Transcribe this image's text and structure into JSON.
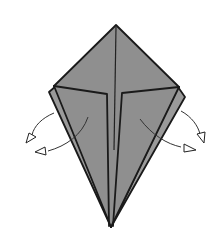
{
  "diagram": {
    "colors": {
      "paper": "#8f8f8f",
      "outline": "#1a1a1a",
      "background": "#ffffff"
    },
    "elements": [
      {
        "name": "kite-base",
        "type": "folded-paper"
      },
      {
        "name": "inner-flap-left",
        "type": "flap"
      },
      {
        "name": "inner-flap-right",
        "type": "flap"
      },
      {
        "name": "center-crease",
        "type": "crease"
      },
      {
        "name": "arrow-left-upper",
        "type": "fold-arrow",
        "direction": "outward-left"
      },
      {
        "name": "arrow-left-lower",
        "type": "fold-arrow",
        "direction": "outward-left"
      },
      {
        "name": "arrow-right-upper",
        "type": "fold-arrow",
        "direction": "outward-right"
      },
      {
        "name": "arrow-right-lower",
        "type": "fold-arrow",
        "direction": "outward-right"
      }
    ]
  }
}
